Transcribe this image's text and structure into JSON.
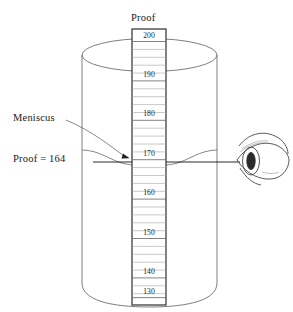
{
  "figure": {
    "title": "Proof",
    "type": "hydrometer-jar-meniscus-reading-diagram",
    "annotations": {
      "meniscus_label": "Meniscus",
      "reading_label": "Proof = 164"
    },
    "reading_value": 164,
    "scale": {
      "unit": "proof",
      "major_labels": [
        "200",
        "190",
        "180",
        "170",
        "160",
        "150",
        "140",
        "130"
      ],
      "major_values": [
        200,
        190,
        180,
        170,
        160,
        150,
        140,
        130
      ],
      "minor_ticks_between_majors": 4,
      "minor_step": 2,
      "top_value": 200,
      "bottom_value": 128,
      "direction": "descending-downward"
    },
    "colors": {
      "ink": "#1a1a1a",
      "line": "#555555",
      "scale_border": "#333333",
      "tick": "#8a8a8a",
      "glass": "#7a7a7a",
      "eye": "#3a3a3a"
    },
    "elements": {
      "cylinder": "graduated-cylinder",
      "liquid_surface": "meniscus-curve",
      "sight_line": "eye-level-sight-line",
      "observer": "eye"
    }
  }
}
